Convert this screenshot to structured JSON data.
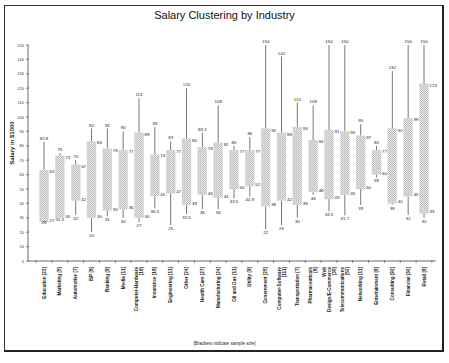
{
  "chart_data": {
    "type": "candlestick-range",
    "title": "Salary Clustering by Industry",
    "xlabel": "",
    "ylabel": "Salary in $1000",
    "note": "[Brackets indicate sample size]",
    "ylim": [
      0,
      150
    ],
    "yticks": [
      0,
      10,
      20,
      30,
      40,
      50,
      60,
      70,
      80,
      90,
      100,
      110,
      120,
      130,
      140,
      150
    ],
    "grid": false,
    "legend": "none",
    "categories": [
      "Education [22]",
      "Marketing [5]",
      "Automotive [7]",
      "ISP [8]",
      "Banking [9]",
      "Media [11]",
      "Computer-Hardware [16]",
      "Insurance [18]",
      "Engineering [11]",
      "Other [24]",
      "Health Care [27]",
      "Manufacturing [24]",
      "Oil and Gas [11]",
      "Utility [9]",
      "Government [25]",
      "Computer-Software [111]",
      "Transportation [7]",
      "Pharmaceuticals [8]",
      "Web Design/E-Commerce [35]",
      "Telecommunications [52]",
      "Networking [11]",
      "Entertainment [8]",
      "Consulting [92]",
      "Financial [30]",
      "Retail [8]"
    ],
    "series": [
      {
        "name": "min",
        "values": [
          29,
          31.5,
          32,
          20,
          31,
          30,
          27,
          36.5,
          25,
          32.5,
          36,
          36,
          43.5,
          44.9,
          22,
          25,
          30,
          46,
          34.5,
          31.7,
          39,
          58,
          39,
          32,
          30
        ]
      },
      {
        "name": "box_low",
        "values": [
          27,
          30,
          42,
          30,
          35,
          36,
          30,
          45,
          47,
          39,
          46,
          44,
          50,
          52,
          38,
          42,
          39,
          48,
          43,
          46,
          50,
          60,
          40,
          45,
          33
        ]
      },
      {
        "name": "box_high",
        "values": [
          63,
          73,
          67,
          83,
          78,
          77,
          89,
          74,
          77,
          85,
          79,
          82,
          77,
          77,
          92,
          89,
          93,
          84,
          91,
          90,
          87,
          77,
          92,
          99,
          123
        ]
      },
      {
        "name": "max",
        "values": [
          82.8,
          75,
          70,
          92,
          92,
          90,
          113,
          93,
          83,
          120,
          89.2,
          108,
          80,
          86,
          150,
          142,
          110,
          108,
          150,
          150,
          95,
          80,
          132,
          150,
          150
        ]
      }
    ]
  }
}
